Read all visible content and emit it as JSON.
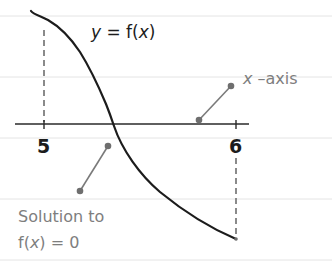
{
  "diagram": {
    "function_label": {
      "prefix": "y",
      "middle": " = f(",
      "var": "x",
      "suffix": ")"
    },
    "axis_label": {
      "var": "x",
      "rest": " –axis"
    },
    "ticks": [
      {
        "label": "5",
        "x_value": 5
      },
      {
        "label": "6",
        "x_value": 6
      }
    ],
    "solution_note": {
      "line1": "Solution to",
      "line2_prefix": "f(",
      "line2_var": "x",
      "line2_suffix": ") = 0"
    },
    "colors": {
      "curve": "#1c1c1c",
      "axis": "#2a2a2a",
      "annotation": "#7e7e7e",
      "rule_lines": "#e4e4e4"
    }
  }
}
